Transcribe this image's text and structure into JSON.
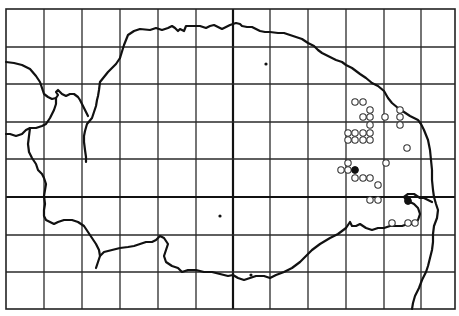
{
  "map": {
    "width": 459,
    "height": 316,
    "colors": {
      "background": "#ffffff",
      "lines": "#111111",
      "open_marker_fill": "#ffffff"
    },
    "grid": {
      "vertical_x": [
        6,
        44,
        82,
        120,
        158,
        196,
        233,
        270,
        308,
        346,
        384,
        421,
        455
      ],
      "horizontal_y": [
        9,
        47,
        84,
        122,
        159,
        197,
        235,
        272,
        309
      ],
      "thick_vertical_x": 233,
      "thick_horizontal_y": 197
    },
    "coastlines": [
      {
        "name": "north-east-coast",
        "points": "120,58 124,45 128,35 134,31 140,29 150,30 156,28 162,30 168,28 172,26 175,28 178,31 180,29 184,31 186,26 192,26 200,26 206,28 210,26 214,25 218,27 222,29 226,27 230,25 236,23 240,24 242,26 247,27 252,27 256,29 260,31 265,32 270,32 278,33 284,33 290,35 296,37 302,39 308,43 314,46 318,50 322,53 330,57 336,60 342,62 346,65 352,68 360,74 366,78 372,83 378,86 384,91 388,98 392,103 398,108 404,112 410,116 418,120 421,124 424,130 428,140 430,150 431,160 432,170 432,180 433,190 434,197 436,204 438,210 437,218 434,226 433,234 433,242 432,250 430,258 428,266 426,272 422,280 419,288 415,296 413,303 412,309"
      },
      {
        "name": "wash-western-shore",
        "points": "120,58 116,64 112,68 108,72 104,77 100,82 99,90 98,96 97,100 96,106 94,112 92,118 87,124 85,131 84,136 84,142 85,150 86,157 86,162"
      },
      {
        "name": "west-river-upper",
        "points": "6,62 14,63 22,65 30,69 36,76 40,82 42,88 44,94 48,97 52,99 56,98 58,95 56,92 58,90 62,94 66,96 70,94 74,94 78,97 80,100 82,104 84,108 86,112 88,116"
      },
      {
        "name": "west-river-loop",
        "points": "56,98 56,104 54,110 52,114 50,118 46,124 42,126 36,128 30,128 26,130 22,134 16,136 10,134 6,134"
      },
      {
        "name": "west-boundary-river",
        "points": "30,128 29,136 28,144 29,152 32,158 36,164 38,170 42,174 44,178 46,184 45,190 44,196 45,204 44,210 44,216 46,220 50,222 54,224 58,222 64,220 72,220 78,222 84,226 88,232 92,238 96,244 99,250 100,256 98,262 96,268"
      },
      {
        "name": "south-boundary-river",
        "points": "100,256 104,252 112,250 120,248 128,247 134,246 140,244 146,242 152,242 156,240 160,236 164,238 168,244 166,250 164,256 166,262 172,266 178,268 182,272 188,270 196,270 204,272 212,272 220,274 228,276 233,275 238,278 244,280 250,278 256,276 264,276 270,278 276,275 284,272 292,268 300,262 306,256 312,250 320,244 330,238 338,234 346,228 350,222 352,226 356,226 360,224 366,228 372,230 378,228 384,228 390,226 396,226 402,226 408,224 414,224 418,220 420,214 418,208 414,204 410,202 406,200 404,197 408,194 414,194 420,198 424,198 428,200 432,202"
      }
    ],
    "markers": {
      "open_circles": [
        {
          "x": 355,
          "y": 102
        },
        {
          "x": 363,
          "y": 102
        },
        {
          "x": 370,
          "y": 110
        },
        {
          "x": 400,
          "y": 110
        },
        {
          "x": 363,
          "y": 117
        },
        {
          "x": 370,
          "y": 117
        },
        {
          "x": 385,
          "y": 117
        },
        {
          "x": 400,
          "y": 117
        },
        {
          "x": 370,
          "y": 125
        },
        {
          "x": 400,
          "y": 125
        },
        {
          "x": 348,
          "y": 133
        },
        {
          "x": 355,
          "y": 133
        },
        {
          "x": 363,
          "y": 133
        },
        {
          "x": 370,
          "y": 133
        },
        {
          "x": 348,
          "y": 140
        },
        {
          "x": 355,
          "y": 140
        },
        {
          "x": 363,
          "y": 140
        },
        {
          "x": 370,
          "y": 140
        },
        {
          "x": 407,
          "y": 148
        },
        {
          "x": 348,
          "y": 163
        },
        {
          "x": 386,
          "y": 163
        },
        {
          "x": 341,
          "y": 170
        },
        {
          "x": 348,
          "y": 170
        },
        {
          "x": 355,
          "y": 178
        },
        {
          "x": 363,
          "y": 178
        },
        {
          "x": 370,
          "y": 178
        },
        {
          "x": 378,
          "y": 185
        },
        {
          "x": 370,
          "y": 200
        },
        {
          "x": 378,
          "y": 200
        },
        {
          "x": 392,
          "y": 223
        },
        {
          "x": 408,
          "y": 223
        },
        {
          "x": 415,
          "y": 223
        }
      ],
      "filled_circles": [
        {
          "x": 355,
          "y": 170
        },
        {
          "x": 408,
          "y": 201
        }
      ],
      "small_dots": [
        {
          "x": 266,
          "y": 64
        },
        {
          "x": 220,
          "y": 216
        },
        {
          "x": 251,
          "y": 275
        }
      ]
    }
  }
}
